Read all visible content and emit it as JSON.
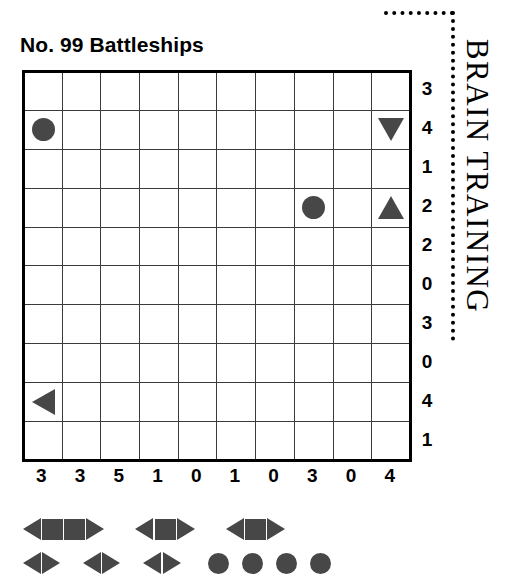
{
  "puzzle": {
    "title": "No. 99 Battleships",
    "grid_size": 10,
    "row_clues": [
      3,
      4,
      1,
      2,
      2,
      0,
      3,
      0,
      4,
      1
    ],
    "col_clues": [
      3,
      3,
      5,
      1,
      0,
      1,
      0,
      3,
      0,
      4
    ],
    "given_pieces": [
      {
        "row": 2,
        "col": 1,
        "piece": "circle"
      },
      {
        "row": 2,
        "col": 10,
        "piece": "triangle-down"
      },
      {
        "row": 4,
        "col": 8,
        "piece": "circle"
      },
      {
        "row": 4,
        "col": 10,
        "piece": "triangle-up"
      },
      {
        "row": 9,
        "col": 1,
        "piece": "triangle-left"
      }
    ]
  },
  "brand": {
    "name": "BRAIN TRAINING"
  },
  "fleet": {
    "rows": [
      [
        {
          "name": "battleship-4",
          "segments": [
            "triangle-left",
            "square",
            "square",
            "triangle-right"
          ]
        },
        {
          "name": "cruiser-3-a",
          "segments": [
            "triangle-left",
            "square",
            "triangle-right"
          ]
        },
        {
          "name": "cruiser-3-b",
          "segments": [
            "triangle-left",
            "square",
            "triangle-right"
          ]
        }
      ],
      [
        {
          "name": "destroyer-2-a",
          "segments": [
            "triangle-left",
            "triangle-right"
          ]
        },
        {
          "name": "destroyer-2-b",
          "segments": [
            "triangle-left",
            "triangle-right"
          ]
        },
        {
          "name": "destroyer-2-c",
          "segments": [
            "triangle-left",
            "triangle-right"
          ]
        },
        {
          "name": "submarine-a",
          "segments": [
            "circle"
          ]
        },
        {
          "name": "submarine-b",
          "segments": [
            "circle"
          ]
        },
        {
          "name": "submarine-c",
          "segments": [
            "circle"
          ]
        },
        {
          "name": "submarine-d",
          "segments": [
            "circle"
          ]
        }
      ]
    ]
  },
  "colors": {
    "piece": "#474747",
    "grid_line": "#3b3b3b",
    "border": "#000000",
    "background": "#ffffff"
  }
}
